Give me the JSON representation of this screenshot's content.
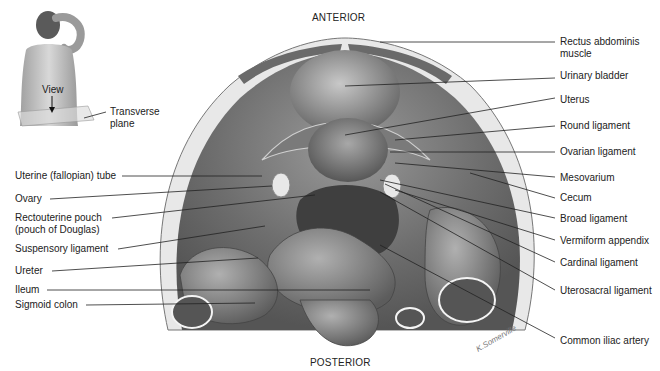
{
  "orientation": {
    "top": "ANTERIOR",
    "bottom": "POSTERIOR"
  },
  "inset": {
    "view_label": "View",
    "plane_label_line1": "Transverse",
    "plane_label_line2": "plane"
  },
  "labels_left": [
    {
      "text": "Uterine (fallopian) tube"
    },
    {
      "text": "Ovary"
    },
    {
      "text": "Rectouterine pouch"
    },
    {
      "text": "(pouch of Douglas)"
    },
    {
      "text": "Suspensory ligament"
    },
    {
      "text": "Ureter"
    },
    {
      "text": "Ileum"
    },
    {
      "text": "Sigmoid colon"
    }
  ],
  "labels_right": [
    {
      "text": "Rectus abdominis"
    },
    {
      "text": "muscle"
    },
    {
      "text": "Urinary bladder"
    },
    {
      "text": "Uterus"
    },
    {
      "text": "Round ligament"
    },
    {
      "text": "Ovarian ligament"
    },
    {
      "text": "Mesovarium"
    },
    {
      "text": "Cecum"
    },
    {
      "text": "Broad ligament"
    },
    {
      "text": "Vermiform appendix"
    },
    {
      "text": "Cardinal ligament"
    },
    {
      "text": "Uterosacral ligament"
    },
    {
      "text": "Common iliac artery"
    }
  ],
  "colors": {
    "background": "#ffffff",
    "tissue_dark": "#5a5a5a",
    "tissue_mid": "#8a8a8a",
    "tissue_light": "#c4c4c4",
    "wall": "#e6e6e6",
    "leader_line": "#222222"
  }
}
